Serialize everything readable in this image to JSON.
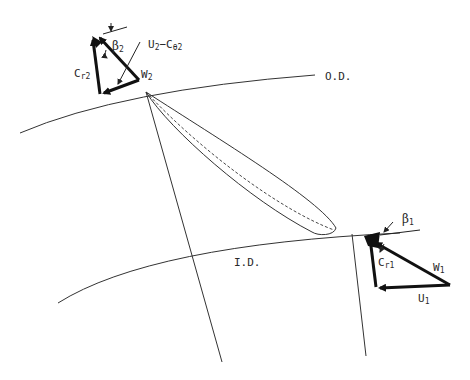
{
  "diagram": {
    "type": "impeller-blade-velocity-triangles",
    "colors": {
      "line": "#333333",
      "vector": "#111111",
      "background": "#ffffff"
    },
    "labels": {
      "outer_diameter": "O.D.",
      "inner_diameter": "I.D.",
      "outlet": {
        "beta": "β",
        "beta_sub": "2",
        "radial_velocity": "C",
        "radial_velocity_sub": "r2",
        "relative_velocity": "W",
        "relative_velocity_sub": "2",
        "slip": "U",
        "slip_sub": "2",
        "slip_minus": "−C",
        "slip_minus_sub": "θ2"
      },
      "inlet": {
        "beta": "β",
        "beta_sub": "1",
        "radial_velocity": "C",
        "radial_velocity_sub": "r1",
        "relative_velocity": "W",
        "relative_velocity_sub": "1",
        "blade_speed": "U",
        "blade_speed_sub": "1"
      }
    }
  }
}
